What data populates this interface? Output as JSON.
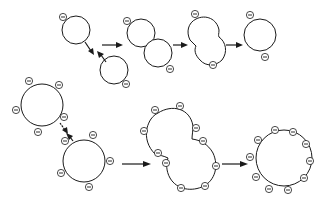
{
  "diagram": {
    "colors": {
      "stroke": "#1a1a1a",
      "background": "#ffffff"
    },
    "charge_symbol": "−",
    "rows": [
      {
        "name": "low-charge-fusion",
        "stages": [
          {
            "name": "separate-vesicles",
            "charges": 2
          },
          {
            "name": "contact",
            "charges": 2
          },
          {
            "name": "fusing",
            "charges": 2
          },
          {
            "name": "fused-vesicle",
            "charges": 2
          }
        ]
      },
      {
        "name": "high-charge-fusion",
        "stages": [
          {
            "name": "separate-vesicles",
            "charges": 10
          },
          {
            "name": "fusing",
            "charges": 10
          },
          {
            "name": "fused-vesicle",
            "charges": 10
          }
        ]
      }
    ]
  }
}
